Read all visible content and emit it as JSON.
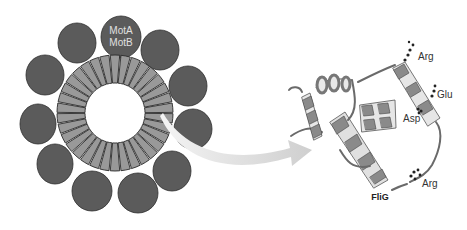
{
  "diagram": {
    "left_panel": {
      "name": "flagellar-motor-ring",
      "stator_label_line1": "MotA",
      "stator_label_line2": "MotB",
      "stator_count": 11,
      "rotor_segment_count": 34,
      "colors": {
        "stator": "#5a5a5a",
        "rotor_segment": "#999999",
        "outline": "#2a2a2a"
      }
    },
    "right_panel": {
      "name": "flig-protein-structure",
      "title": "FliG",
      "residues": [
        {
          "label": "Arg",
          "position": "top"
        },
        {
          "label": "Glu",
          "position": "right"
        },
        {
          "label": "Asp",
          "position": "middle"
        },
        {
          "label": "Arg",
          "position": "bottom"
        }
      ],
      "colors": {
        "helix": "#888888",
        "helix_inner": "#e8e8e8",
        "coil": "#6a6a6a"
      }
    },
    "arrow": {
      "from": "rotor-segment",
      "to": "flig-structure",
      "color": "#d8d8d8"
    }
  }
}
